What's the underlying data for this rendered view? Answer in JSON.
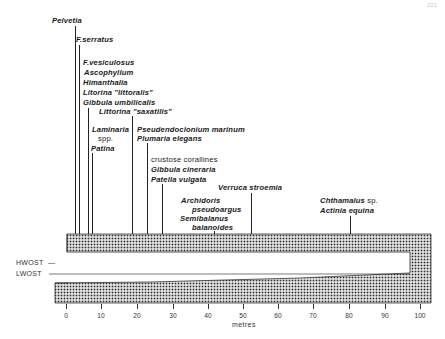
{
  "page_number": "221",
  "axis": {
    "label": "metres",
    "ticks": [
      "0",
      "10",
      "20",
      "30",
      "40",
      "50",
      "60",
      "70",
      "80",
      "90",
      "100"
    ],
    "range": [
      0,
      100
    ]
  },
  "water_levels": {
    "hwost": "HWOST",
    "lwost": "LWOST"
  },
  "species": [
    {
      "lines": [
        "Pelvetia"
      ],
      "position_m": 2
    },
    {
      "lines": [
        "F.serratus"
      ],
      "position_m": 3
    },
    {
      "lines": [
        "F.vesiculosus",
        "Ascophyllum",
        "Himanthalia",
        "Litorina \"littoralis\"",
        "Gibbula umbilicalis"
      ],
      "position_m": 5.5
    },
    {
      "lines": [
        "Littorina \"saxatilis\""
      ],
      "position_m": 19
    },
    {
      "lines": [
        "Laminaria",
        "spp.",
        "Patina"
      ],
      "position_m": 6.5
    },
    {
      "lines": [
        "Pseudendoclonium marinum",
        "Plumaria elegans"
      ],
      "position_m": 23
    },
    {
      "lines": [
        "crustose corallines",
        "Gibbula cineraria",
        "Patella vulgata"
      ],
      "position_m": 27.5
    },
    {
      "lines": [
        "Verruca stroemia"
      ],
      "position_m": 52
    },
    {
      "lines": [
        "Archidoris",
        "pseudoargus",
        "Semibalanus",
        "balanoides"
      ],
      "position_m": 41
    },
    {
      "lines": [
        "Chthamalus sp.",
        "Actinia equina"
      ],
      "position_m": 80
    }
  ],
  "labels": {
    "pelvetia": "Pelvetia",
    "fserratus": "F.serratus",
    "fvesiculosus": "F.vesiculosus",
    "ascophyllum": "Ascophyllum",
    "himanthalia": "Himanthalia",
    "litorina_littoralis": "Litorina \"littoralis\"",
    "gibbula_umbilicalis": "Gibbula umbilicalis",
    "littorina_saxatilis": "Littorina \"saxatilis\"",
    "laminaria": "Laminaria",
    "laminaria_spp": "spp.",
    "patina": "Patina",
    "pseudendoclonium": "Pseudendoclonium marinum",
    "plumaria": "Plumaria elegans",
    "crustose": "crustose corallines",
    "gibbula_cineraria": "Gibbula cineraria",
    "patella": "Patella vulgata",
    "verruca": "Verruca stroemia",
    "archidoris": "Archidoris",
    "pseudoargus": "pseudoargus",
    "semibalanus": "Semibalanus",
    "balanoides": "balanoides",
    "chthamalus": "Chthamalus",
    "chthamalus_sp": "sp.",
    "actinia": "Actinia equina"
  }
}
